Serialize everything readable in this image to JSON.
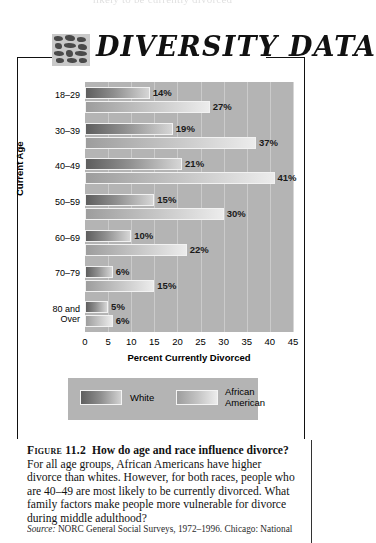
{
  "banner": {
    "title": "DIVERSITY DATA",
    "glyph": "mosaic-icon"
  },
  "top_bleed": "likely to be currently divorced",
  "chart_data": {
    "type": "bar",
    "orientation": "horizontal",
    "title": "",
    "xlabel": "Percent Currently Divorced",
    "ylabel": "Current Age",
    "categories": [
      "18–29",
      "30–39",
      "40–49",
      "50–59",
      "60–69",
      "70–79",
      "80 and Over"
    ],
    "series": [
      {
        "name": "White",
        "color": "#7d7d7d",
        "values": [
          14,
          19,
          21,
          15,
          10,
          6,
          5
        ],
        "labels": [
          "14%",
          "19%",
          "21%",
          "15%",
          "10%",
          "6%",
          "5%"
        ]
      },
      {
        "name": "African American",
        "color": "#c0c0c0",
        "values": [
          27,
          37,
          41,
          30,
          22,
          15,
          6
        ],
        "labels": [
          "27%",
          "37%",
          "41%",
          "30%",
          "22%",
          "15%",
          "6%"
        ]
      }
    ],
    "xlim": [
      0,
      45
    ],
    "xticks": [
      0,
      5,
      10,
      15,
      20,
      25,
      30,
      35,
      40,
      45
    ],
    "xticklabels": [
      "0",
      "5",
      "10",
      "15",
      "20",
      "25",
      "30",
      "35",
      "40",
      "45"
    ],
    "grid": true,
    "legend_position": "bottom",
    "plot_background": "#b4b4b4"
  },
  "legend": {
    "white": "White",
    "african_american_line1": "African",
    "african_american_line2": "American"
  },
  "caption": {
    "figure_number": "Figure 11.2",
    "question": "How do age and race influence divorce?",
    "body": "For all age groups, African Americans have higher divorce than whites. However, for both races, people who are 40–49 are most likely to be currently divorced. What family factors make people more vulnerable for divorce during middle adulthood?",
    "source_label": "Source:",
    "source_text": "NORC General Social Surveys, 1972–1996. Chicago: National"
  }
}
